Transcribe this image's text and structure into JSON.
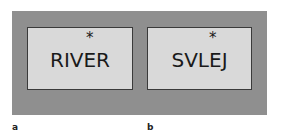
{
  "panels": [
    {
      "label": "a",
      "word": "RIVER",
      "marker": "*"
    },
    {
      "label": "b",
      "word": "SVLEJ",
      "marker": "*"
    }
  ],
  "colors": {
    "background": "#8f8f8f",
    "box": "#d9d9d9",
    "text": "#1a1a1a"
  }
}
